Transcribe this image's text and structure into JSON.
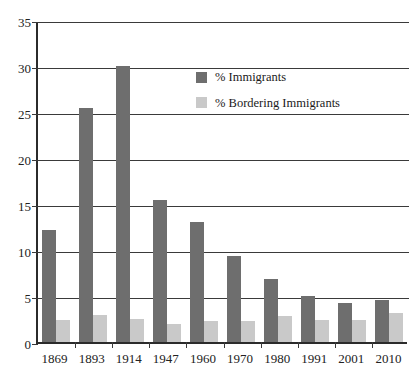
{
  "chart_data": {
    "type": "bar",
    "title": "",
    "subtitle": "",
    "xlabel": "",
    "ylabel": "",
    "categories": [
      "1869",
      "1893",
      "1914",
      "1947",
      "1960",
      "1970",
      "1980",
      "1991",
      "2001",
      "2010"
    ],
    "series": [
      {
        "name": "% Immigrants",
        "color": "#6e6e6e",
        "values": [
          12.2,
          25.4,
          30.0,
          15.4,
          13.0,
          9.4,
          6.8,
          5.0,
          4.2,
          4.6
        ]
      },
      {
        "name": "% Bordering Immigrants",
        "color": "#c9c9c9",
        "values": [
          2.4,
          2.9,
          2.5,
          2.0,
          2.3,
          2.3,
          2.8,
          2.4,
          2.4,
          3.1
        ]
      }
    ],
    "ylim": [
      0,
      35
    ],
    "yticks": [
      "0",
      "5",
      "10",
      "15",
      "20",
      "25",
      "30",
      "35"
    ],
    "ytick_values": [
      0,
      5,
      10,
      15,
      20,
      25,
      30,
      35
    ],
    "grid": true,
    "legend_position": "upper-center-right",
    "annotations": []
  },
  "legend": {
    "entries": [
      {
        "label": "% Immigrants"
      },
      {
        "label": "% Bordering Immigrants"
      }
    ]
  }
}
